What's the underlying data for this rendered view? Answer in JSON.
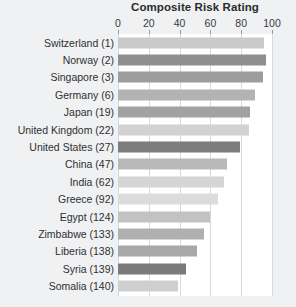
{
  "chart_data": {
    "type": "bar",
    "orientation": "horizontal",
    "title": "Composite Risk Rating",
    "xlabel": "",
    "ylabel": "",
    "xlim": [
      0,
      100
    ],
    "xticks": [
      0,
      20,
      40,
      60,
      80,
      100
    ],
    "grid": true,
    "legend": null,
    "categories": [
      "Switzerland (1)",
      "Norway (2)",
      "Singapore (3)",
      "Germany (6)",
      "Japan (19)",
      "United Kingdom (22)",
      "United States (27)",
      "China (47)",
      "India (62)",
      "Greece (92)",
      "Egypt (124)",
      "Zimbabwe (133)",
      "Liberia (138)",
      "Syria (139)",
      "Somalia (140)"
    ],
    "values": [
      95,
      96,
      94,
      89,
      86,
      85,
      79,
      71,
      69,
      65,
      60,
      56,
      51,
      44,
      39
    ],
    "bar_colors": [
      "#c9c9c9",
      "#8f8f8f",
      "#9d9d9d",
      "#b3b3b3",
      "#a1a1a1",
      "#d2d2d2",
      "#7d7d7d",
      "#b9b9b9",
      "#d5d5d5",
      "#dcdcdc",
      "#c2c2c2",
      "#b0b0b0",
      "#a8a8a8",
      "#7a7a7a",
      "#cfcfcf"
    ]
  },
  "colors": {
    "page_background": "#eff1f3",
    "plot_background": "#ffffff",
    "gridline": "#d9d9d9",
    "text": "#2f2f2f",
    "title_text": "#2b2b2b"
  }
}
